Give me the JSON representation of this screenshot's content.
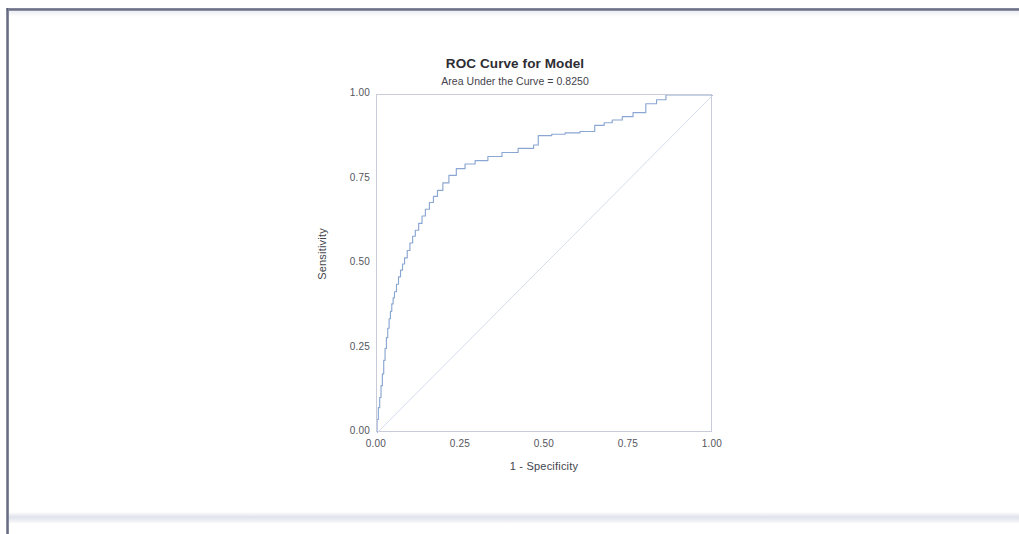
{
  "document": {
    "kind": "scanned-page",
    "page_background": "#ffffff",
    "frame_color": "#5a5f77"
  },
  "figure": {
    "title": "ROC Curve for Model",
    "subtitle": "Area Under the Curve = 0.8250",
    "x_axis_label": "1 - Specificity",
    "y_axis_label": "Sensitivity",
    "x_tick_labels": [
      "0.00",
      "0.25",
      "0.50",
      "0.75",
      "1.00"
    ],
    "y_tick_labels": [
      "0.00",
      "0.25",
      "0.50",
      "0.75",
      "1.00"
    ],
    "curve_color": "#8aa6d2",
    "reference_line_color": "#d7dced",
    "frame_color": "#c9ccd8"
  },
  "chart_data": {
    "type": "line",
    "title": "ROC Curve for Model",
    "subtitle": "Area Under the Curve = 0.8250",
    "auc": 0.825,
    "xlabel": "1 - Specificity",
    "ylabel": "Sensitivity",
    "xlim": [
      0.0,
      1.0
    ],
    "ylim": [
      0.0,
      1.0
    ],
    "xticks": [
      0.0,
      0.25,
      0.5,
      0.75,
      1.0
    ],
    "yticks": [
      0.0,
      0.25,
      0.5,
      0.75,
      1.0
    ],
    "grid": false,
    "legend": null,
    "series": [
      {
        "name": "ROC curve",
        "color": "#8aa6d2",
        "style": "step",
        "x": [
          0.0,
          0.0,
          0.004,
          0.004,
          0.008,
          0.008,
          0.012,
          0.012,
          0.016,
          0.016,
          0.02,
          0.02,
          0.024,
          0.024,
          0.028,
          0.028,
          0.032,
          0.032,
          0.036,
          0.036,
          0.04,
          0.04,
          0.044,
          0.044,
          0.048,
          0.048,
          0.052,
          0.052,
          0.058,
          0.058,
          0.064,
          0.064,
          0.07,
          0.07,
          0.076,
          0.076,
          0.082,
          0.082,
          0.09,
          0.09,
          0.098,
          0.098,
          0.106,
          0.106,
          0.114,
          0.114,
          0.124,
          0.124,
          0.134,
          0.134,
          0.144,
          0.144,
          0.156,
          0.156,
          0.168,
          0.168,
          0.18,
          0.18,
          0.196,
          0.196,
          0.214,
          0.214,
          0.236,
          0.236,
          0.262,
          0.262,
          0.292,
          0.292,
          0.33,
          0.33,
          0.372,
          0.372,
          0.42,
          0.42,
          0.466,
          0.466,
          0.48,
          0.48,
          0.52,
          0.52,
          0.56,
          0.56,
          0.604,
          0.604,
          0.648,
          0.648,
          0.676,
          0.676,
          0.7,
          0.7,
          0.73,
          0.73,
          0.762,
          0.762,
          0.8,
          0.8,
          0.832,
          0.832,
          0.86,
          0.86,
          1.0
        ],
        "y": [
          0.0,
          0.04,
          0.04,
          0.075,
          0.075,
          0.105,
          0.105,
          0.14,
          0.14,
          0.175,
          0.175,
          0.215,
          0.215,
          0.25,
          0.25,
          0.282,
          0.282,
          0.31,
          0.31,
          0.338,
          0.338,
          0.36,
          0.36,
          0.382,
          0.382,
          0.4,
          0.4,
          0.418,
          0.418,
          0.44,
          0.44,
          0.462,
          0.462,
          0.482,
          0.482,
          0.5,
          0.5,
          0.518,
          0.518,
          0.54,
          0.54,
          0.562,
          0.562,
          0.582,
          0.582,
          0.6,
          0.6,
          0.62,
          0.62,
          0.642,
          0.642,
          0.662,
          0.662,
          0.682,
          0.682,
          0.7,
          0.7,
          0.718,
          0.718,
          0.74,
          0.74,
          0.762,
          0.762,
          0.782,
          0.782,
          0.796,
          0.796,
          0.806,
          0.806,
          0.818,
          0.818,
          0.83,
          0.83,
          0.842,
          0.842,
          0.852,
          0.852,
          0.88,
          0.88,
          0.884,
          0.884,
          0.888,
          0.888,
          0.892,
          0.892,
          0.91,
          0.91,
          0.918,
          0.918,
          0.926,
          0.926,
          0.936,
          0.936,
          0.948,
          0.948,
          0.974,
          0.974,
          0.986,
          0.986,
          1.0,
          1.0
        ]
      },
      {
        "name": "Reference line (chance)",
        "color": "#d7dced",
        "style": "diagonal",
        "x": [
          0.0,
          1.0
        ],
        "y": [
          0.0,
          1.0
        ]
      }
    ]
  }
}
